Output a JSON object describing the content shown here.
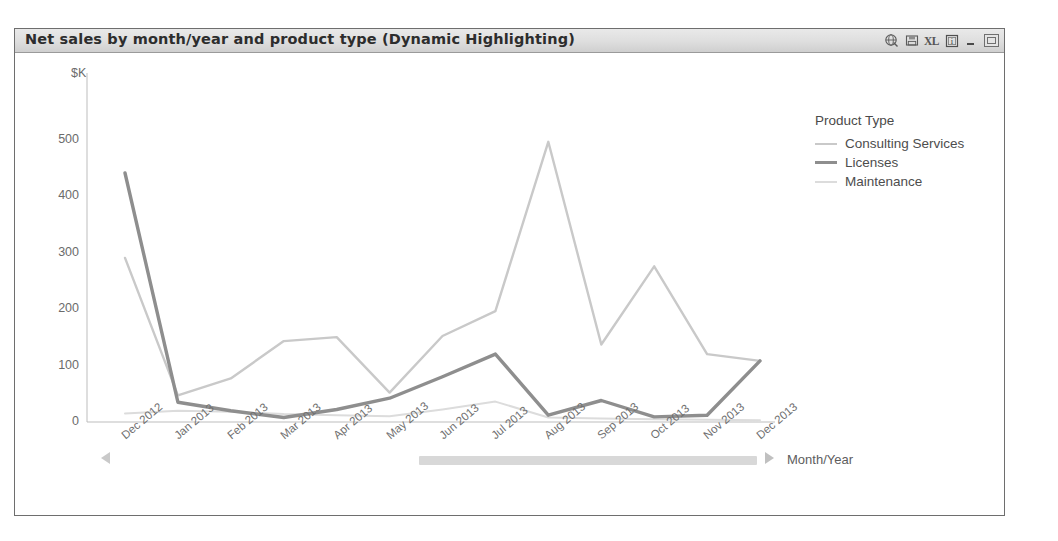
{
  "window": {
    "title": "Net sales by month/year and product type (Dynamic Highlighting)",
    "buttons": [
      {
        "name": "world-globe-icon",
        "label": "",
        "tooltip": "Globe"
      },
      {
        "name": "save-disk-icon",
        "label": "",
        "tooltip": "Save"
      },
      {
        "name": "excel-export-icon",
        "label": "XL",
        "tooltip": "Export to Excel"
      },
      {
        "name": "info-box-icon",
        "label": "i",
        "tooltip": "Information"
      },
      {
        "name": "minimize-button",
        "label": "",
        "tooltip": "Minimize"
      },
      {
        "name": "maximize-button",
        "label": "",
        "tooltip": "Maximize"
      }
    ]
  },
  "legend": {
    "title": "Product Type",
    "entries": [
      {
        "label": "Consulting Services",
        "color": "#c9c9c9",
        "width": 2.4
      },
      {
        "label": "Licenses",
        "color": "#8e8e8e",
        "width": 3.4
      },
      {
        "label": "Maintenance",
        "color": "#dcdcdc",
        "width": 2.0
      }
    ]
  },
  "axis": {
    "y_unit": "$K",
    "x_title": "Month/Year"
  },
  "pan": {
    "left_arrow": "left-arrow-icon",
    "right_arrow": "right-arrow-icon",
    "track": "horizontal-pan-track"
  },
  "colors": {
    "frame_border": "#6e6e6e",
    "titlebar_bg": "#dedede",
    "axis_line": "#b9b9b9",
    "tick_text": "#6b6b6b",
    "plot_bg": "#ffffff"
  },
  "chart_data": {
    "type": "line",
    "title": "Net sales by month/year and product type (Dynamic Highlighting)",
    "xlabel": "Month/Year",
    "ylabel": "$K",
    "ylim": [
      0,
      560
    ],
    "yticks": [
      0,
      100,
      200,
      300,
      400,
      500
    ],
    "grid": false,
    "legend_position": "right",
    "legend_title": "Product Type",
    "categories": [
      "Dec 2012",
      "Jan 2013",
      "Feb 2013",
      "Mar 2013",
      "Apr 2013",
      "May 2013",
      "Jun 2013",
      "Jul 2013",
      "Aug 2013",
      "Sep 2013",
      "Oct 2013",
      "Nov 2013",
      "Dec 2013"
    ],
    "series": [
      {
        "name": "Consulting Services",
        "color": "#c9c9c9",
        "values": [
          290,
          47,
          77,
          143,
          150,
          52,
          152,
          196,
          495,
          137,
          275,
          120,
          108
        ]
      },
      {
        "name": "Licenses",
        "color": "#8e8e8e",
        "values": [
          440,
          35,
          20,
          8,
          22,
          42,
          80,
          120,
          12,
          38,
          9,
          12,
          108
        ]
      },
      {
        "name": "Maintenance",
        "color": "#dcdcdc",
        "values": [
          15,
          20,
          18,
          14,
          12,
          10,
          22,
          36,
          8,
          6,
          5,
          4,
          3
        ]
      }
    ]
  }
}
